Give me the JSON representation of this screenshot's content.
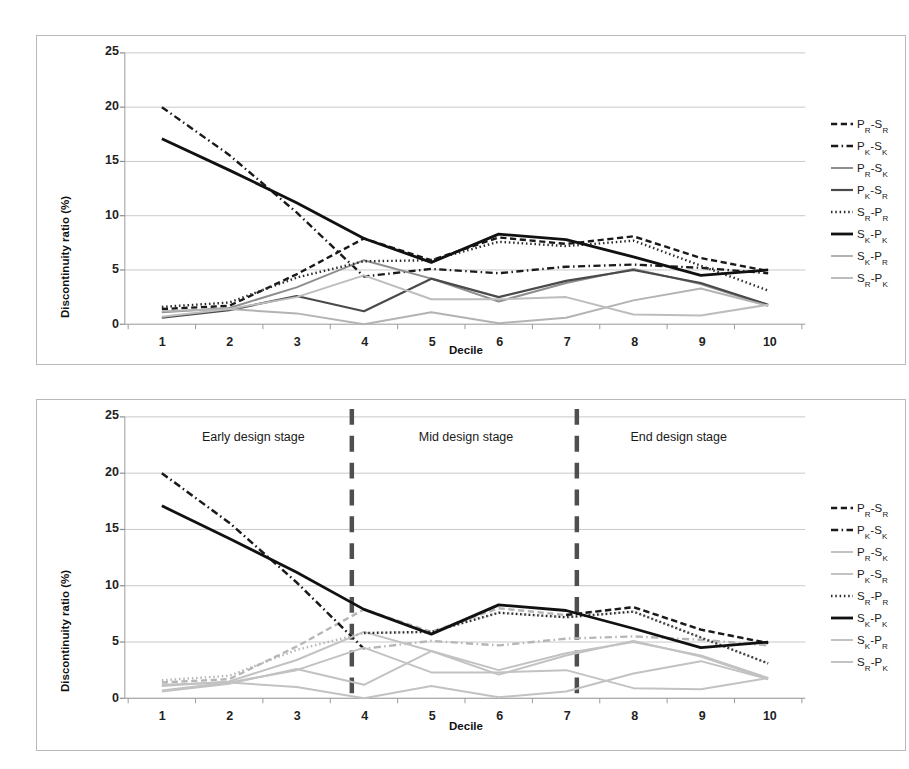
{
  "figure": {
    "background": "#ffffff",
    "frame_color": "#b9b9b9"
  },
  "chart_data": [
    {
      "id": "top",
      "type": "line",
      "title": "",
      "xlabel": "Decile",
      "ylabel": "Discontinuity ratio (%)",
      "x": [
        1,
        2,
        3,
        4,
        5,
        6,
        7,
        8,
        9,
        10
      ],
      "xticklabels": [
        "1",
        "2",
        "3",
        "4",
        "5",
        "6",
        "7",
        "8",
        "9",
        "10"
      ],
      "yticks": [
        0,
        5,
        10,
        15,
        20,
        25
      ],
      "yticklabels": [
        "0",
        "5",
        "10",
        "15",
        "20",
        "25"
      ],
      "ylim": [
        0,
        25
      ],
      "xlim": [
        0.45,
        10.55
      ],
      "grid": "horizontal",
      "legend_position": "right",
      "series": [
        {
          "name": "PR-SR",
          "label_main": "P",
          "label_sub1": "R",
          "label_mid": "-S",
          "label_sub2": "R",
          "style": "dashed",
          "color": "#1a1a1a",
          "width": 2.4,
          "values": [
            1.4,
            1.7,
            4.6,
            7.9,
            5.9,
            8.0,
            7.4,
            8.1,
            6.1,
            4.9
          ]
        },
        {
          "name": "PK-SK",
          "label_main": "P",
          "label_sub1": "K",
          "label_mid": "-S",
          "label_sub2": "K",
          "style": "dashdot",
          "color": "#1a1a1a",
          "width": 2.4,
          "values": [
            20.0,
            15.6,
            10.3,
            4.4,
            5.1,
            4.7,
            5.3,
            5.5,
            5.2,
            4.7
          ]
        },
        {
          "name": "PR-SK",
          "label_main": "P",
          "label_sub1": "R",
          "label_mid": "-S",
          "label_sub2": "K",
          "style": "solid",
          "color": "#8e8e8e",
          "width": 2.0,
          "values": [
            1.1,
            1.5,
            3.4,
            5.9,
            4.2,
            2.1,
            3.8,
            5.1,
            3.7,
            1.7
          ]
        },
        {
          "name": "PK-SR",
          "label_main": "P",
          "label_sub1": "K",
          "label_mid": "-S",
          "label_sub2": "R",
          "style": "solid",
          "color": "#4a4a4a",
          "width": 2.2,
          "values": [
            0.6,
            1.3,
            2.6,
            1.2,
            4.2,
            2.5,
            4.0,
            5.0,
            3.8,
            1.8
          ]
        },
        {
          "name": "SR-PR",
          "label_main": "S",
          "label_sub1": "R",
          "label_mid": "-P",
          "label_sub2": "R",
          "style": "dotted",
          "color": "#2a2a2a",
          "width": 2.4,
          "values": [
            1.6,
            2.0,
            4.3,
            5.8,
            5.9,
            7.6,
            7.2,
            7.7,
            5.4,
            3.1
          ]
        },
        {
          "name": "SK-PK",
          "label_main": "S",
          "label_sub1": "K",
          "label_mid": "-P",
          "label_sub2": "K",
          "style": "solid",
          "color": "#111111",
          "width": 2.8,
          "values": [
            17.1,
            14.2,
            11.2,
            7.9,
            5.7,
            8.3,
            7.8,
            6.2,
            4.5,
            5.0
          ]
        },
        {
          "name": "SK-PR",
          "label_main": "S",
          "label_sub1": "K",
          "label_mid": "-P",
          "label_sub2": "R",
          "style": "solid",
          "color": "#b3b3b3",
          "width": 2.0,
          "values": [
            1.2,
            1.4,
            1.0,
            0.0,
            1.1,
            0.1,
            0.6,
            2.2,
            3.3,
            1.7
          ]
        },
        {
          "name": "SR-PK",
          "label_main": "S",
          "label_sub1": "R",
          "label_mid": "-P",
          "label_sub2": "K",
          "style": "solid",
          "color": "#bdbdbd",
          "width": 2.0,
          "values": [
            0.7,
            1.4,
            2.5,
            4.5,
            2.3,
            2.3,
            2.5,
            0.9,
            0.8,
            1.8
          ]
        }
      ]
    },
    {
      "id": "bottom",
      "type": "line",
      "title": "",
      "xlabel": "Decile",
      "ylabel": "Discontinuity ratio (%)",
      "x": [
        1,
        2,
        3,
        4,
        5,
        6,
        7,
        8,
        9,
        10
      ],
      "xticklabels": [
        "1",
        "2",
        "3",
        "4",
        "5",
        "6",
        "7",
        "8",
        "9",
        "10"
      ],
      "yticks": [
        0,
        5,
        10,
        15,
        20,
        25
      ],
      "yticklabels": [
        "0",
        "5",
        "10",
        "15",
        "20",
        "25"
      ],
      "ylim": [
        0,
        25
      ],
      "xlim": [
        0.45,
        10.55
      ],
      "grid": "horizontal",
      "legend_position": "right",
      "annotations": [
        {
          "name": "early-stage-label",
          "text": "Early design stage",
          "x": 2.35,
          "y": 23.1
        },
        {
          "name": "mid-stage-label",
          "text": "Mid design stage",
          "x": 5.5,
          "y": 23.1
        },
        {
          "name": "end-stage-label",
          "text": "End design stage",
          "x": 8.65,
          "y": 23.1
        }
      ],
      "dividers": [
        {
          "name": "divider-early-mid",
          "x": 3.82,
          "color": "#4f4f4f"
        },
        {
          "name": "divider-mid-end",
          "x": 7.16,
          "color": "#4f4f4f"
        }
      ],
      "series": [
        {
          "name": "PR-SR",
          "label_main": "P",
          "label_sub1": "R",
          "label_mid": "-S",
          "label_sub2": "R",
          "style": "dashed",
          "color": "#b6b6b6",
          "color_emphasis": "#1a1a1a",
          "emphasis_from": 7,
          "emphasis_to": 10,
          "width": 2.4,
          "values": [
            1.4,
            1.7,
            4.6,
            7.9,
            5.9,
            8.0,
            7.4,
            8.1,
            6.1,
            4.9
          ]
        },
        {
          "name": "PK-SK",
          "label_main": "P",
          "label_sub1": "K",
          "label_mid": "-S",
          "label_sub2": "K",
          "style": "dashdot",
          "color": "#b6b6b6",
          "color_emphasis": "#1a1a1a",
          "emphasis_from": 1,
          "emphasis_to": 4,
          "width": 2.4,
          "values": [
            20.0,
            15.6,
            10.3,
            4.4,
            5.1,
            4.7,
            5.3,
            5.5,
            5.2,
            4.7
          ]
        },
        {
          "name": "PR-SK",
          "label_main": "P",
          "label_sub1": "R",
          "label_mid": "-S",
          "label_sub2": "K",
          "style": "solid",
          "color": "#c2c2c2",
          "width": 2.0,
          "values": [
            1.1,
            1.5,
            3.4,
            5.9,
            4.2,
            2.1,
            3.8,
            5.1,
            3.7,
            1.7
          ]
        },
        {
          "name": "PK-SR",
          "label_main": "P",
          "label_sub1": "K",
          "label_mid": "-S",
          "label_sub2": "R",
          "style": "solid",
          "color": "#c2c2c2",
          "width": 2.0,
          "values": [
            0.6,
            1.3,
            2.6,
            1.2,
            4.2,
            2.5,
            4.0,
            5.0,
            3.8,
            1.8
          ]
        },
        {
          "name": "SR-PR",
          "label_main": "S",
          "label_sub1": "R",
          "label_mid": "-P",
          "label_sub2": "R",
          "style": "dotted",
          "color": "#b6b6b6",
          "color_emphasis": "#2a2a2a",
          "emphasis_from": 4,
          "emphasis_to": 10,
          "width": 2.4,
          "values": [
            1.6,
            2.0,
            4.3,
            5.8,
            5.9,
            7.6,
            7.2,
            7.7,
            5.4,
            3.1
          ]
        },
        {
          "name": "SK-PK",
          "label_main": "S",
          "label_sub1": "K",
          "label_mid": "-P",
          "label_sub2": "K",
          "style": "solid",
          "color": "#111111",
          "width": 2.8,
          "values": [
            17.1,
            14.2,
            11.2,
            7.9,
            5.7,
            8.3,
            7.8,
            6.2,
            4.5,
            5.0
          ]
        },
        {
          "name": "SK-PR",
          "label_main": "S",
          "label_sub1": "K",
          "label_mid": "-P",
          "label_sub2": "R",
          "style": "solid",
          "color": "#c2c2c2",
          "width": 2.0,
          "values": [
            1.2,
            1.4,
            1.0,
            0.0,
            1.1,
            0.1,
            0.6,
            2.2,
            3.3,
            1.7
          ]
        },
        {
          "name": "SR-PK",
          "label_main": "S",
          "label_sub1": "R",
          "label_mid": "-P",
          "label_sub2": "K",
          "style": "solid",
          "color": "#c2c2c2",
          "width": 2.0,
          "values": [
            0.7,
            1.4,
            2.5,
            4.5,
            2.3,
            2.3,
            2.5,
            0.9,
            0.8,
            1.8
          ]
        }
      ]
    }
  ]
}
